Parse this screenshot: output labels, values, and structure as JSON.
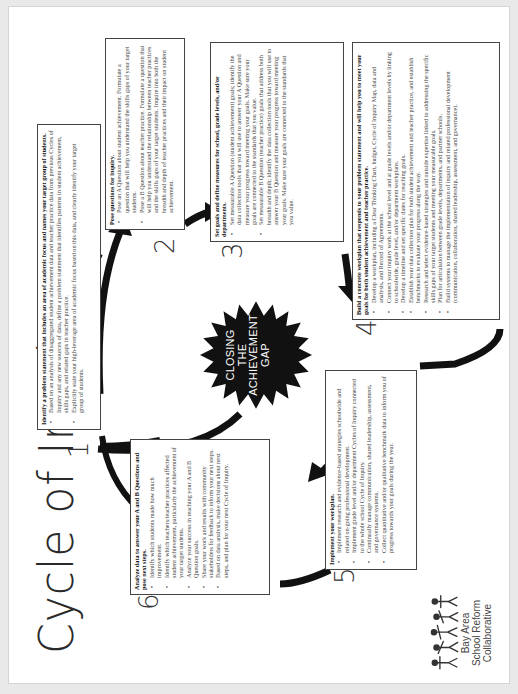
{
  "title": "Cycle of Inquiry",
  "center_badge": {
    "lines": [
      "CLOSING",
      "THE",
      "ACHIEVEMENT",
      "GAP"
    ]
  },
  "steps": [
    {
      "number": "1",
      "heading": "Identify a problem statement that includes an area of academic focus and names your target group of students.",
      "bullets": [
        "Based on an analysis of disaggregated student achievement data and teacher practice data from previous Cycles of Inquiry and any new sources of data, define a problem statement that identifies patterns in student achievement, skills gaps, and related gaps in teacher practice.",
        "Explicitly state your high-leverage area of academic focus based on this data, and clearly identify your target group of students."
      ]
    },
    {
      "number": "2",
      "heading": "Pose questions for inquiry.",
      "bullets": [
        "Pose an A Question about student achievement. Formulate a question that will help you understand the skills gaps of your target students.",
        "Pose a B Question about teacher practice. Formulate a question that will help you understand the relationship between teacher practices and the skills gaps of your target students. Inquire into both the breadth and depth of teacher practices and their impact on student achievement."
      ]
    },
    {
      "number": "3",
      "heading": "Set goals and define measures for school, grade levels, and/or departments.",
      "bullets": [
        "Set measurable A Question (student achievement) goals; identify the data collection tools that you will use to answer your A Question and measure your progress toward meeting your goals. Make sure your goals are connected to the standards that you value.",
        "Set measurable B Question (teacher practice) goals that address both breadth and depth; identify the data collection tools that you will use to answer your B Question and measure your progress toward meeting your goals. Make sure your goals are connected to the standards that you value."
      ]
    },
    {
      "number": "4",
      "heading": "Build a concrete workplan that responds to your problem statement and will help you to meet your goals for both student achievement and teacher practice.",
      "bullets": [
        "Develop a workplan, including a Clear Thinking Chart, budget, Cycle of Inquiry Map, data and analysis, and Record of Agreements.",
        "Connect your inquiry work at the school level and at grade levels and/or department levels by linking to schoolwide, grade level, and/or department workplans.",
        "Develop a timeline and set specific dates for reaching goals.",
        "Establish your data collection plan for both student achievement and teacher practice, and establish benchmarks to evaluate your progress along the way.",
        "Research and select evidence-based strategies and outside expertise linked to addressing the specific skills gaps of your target students and meeting your measurable goals.",
        "Plan for articulation between grade levels, departments, and partner schools.",
        "Build systems to manage the implementation of inquiry and related professional development (communication, collaboration, shared leadership, assessment, and governance)."
      ]
    },
    {
      "number": "5",
      "heading": "Implement your workplan.",
      "bullets": [
        "Implement research and evidence-based strategies schoolwide and related on-going professional development.",
        "Implement grade level and/or department Cycles of Inquiry connected to the whole school Cycle of Inquiry.",
        "Continually manage communication, shared leadership, assessment, and governance systems.",
        "Collect quantitative and/or qualitative benchmark data to inform you of progress towards your goals during the year."
      ]
    },
    {
      "number": "6",
      "heading": "Analyze data to answer your A and B Questions and pose next steps.",
      "bullets": [
        "Identify which students made how much improvement.",
        "Identify which teachers/teacher practices affected student achievement, particularly the achievement of your target students.",
        "Analyze your success in reaching your A and B Question goals.",
        "Share your work and results with community stakeholders for feedback to inform your next steps.",
        "Based on data analysis, make decisions about next steps, and plan for your next Cycle of Inquiry."
      ]
    }
  ],
  "logo": {
    "icon": "dancing-figures-logo-icon",
    "lines": [
      "Bay Area",
      "School Reform",
      "Collaborative"
    ]
  },
  "colors": {
    "ink": "#111111",
    "box_border": "#444444",
    "text": "#444444",
    "paper": "#ffffff"
  }
}
